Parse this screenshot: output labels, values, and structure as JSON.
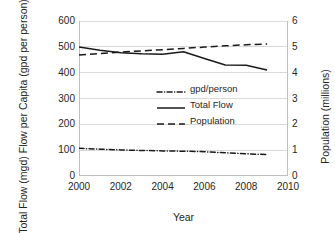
{
  "chart_data": {
    "type": "line",
    "title": "",
    "xlabel": "Year",
    "ylabel_left_line1": "Total Flow (mgd)",
    "ylabel_left_line2": "Flow per Capita (gpd per person)",
    "ylabel_right": "Population (millions)",
    "x": [
      2000,
      2001,
      2002,
      2003,
      2004,
      2005,
      2006,
      2007,
      2008,
      2009
    ],
    "xlim": [
      2000,
      2010
    ],
    "xticks": [
      "2000",
      "2002",
      "2004",
      "2006",
      "2008",
      "2010"
    ],
    "xtick_values": [
      2000,
      2002,
      2004,
      2006,
      2008,
      2010
    ],
    "ylim_left": [
      0,
      600
    ],
    "yticks_left": [
      "0",
      "100",
      "200",
      "300",
      "400",
      "500",
      "600"
    ],
    "ytick_values_left": [
      0,
      100,
      200,
      300,
      400,
      500,
      600
    ],
    "ylim_right": [
      0,
      6
    ],
    "yticks_right": [
      "0",
      "1",
      "2",
      "3",
      "4",
      "5",
      "6"
    ],
    "ytick_values_right": [
      0,
      1,
      2,
      3,
      4,
      5,
      6
    ],
    "grid": true,
    "legend_position": "center",
    "series": [
      {
        "name": "gpd/person",
        "axis": "left",
        "style": "dash-dot",
        "color": "#1a1a1a",
        "values": [
          107,
          104,
          101,
          99,
          97,
          96,
          94,
          90,
          86,
          83
        ]
      },
      {
        "name": "Total Flow",
        "axis": "left",
        "style": "solid",
        "color": "#1a1a1a",
        "values": [
          499,
          487,
          477,
          473,
          471,
          481,
          455,
          430,
          429,
          410
        ]
      },
      {
        "name": "Population",
        "axis": "right",
        "style": "dashed",
        "color": "#1a1a1a",
        "values": [
          4.68,
          4.74,
          4.8,
          4.84,
          4.89,
          4.94,
          4.99,
          5.04,
          5.08,
          5.11
        ]
      }
    ]
  }
}
